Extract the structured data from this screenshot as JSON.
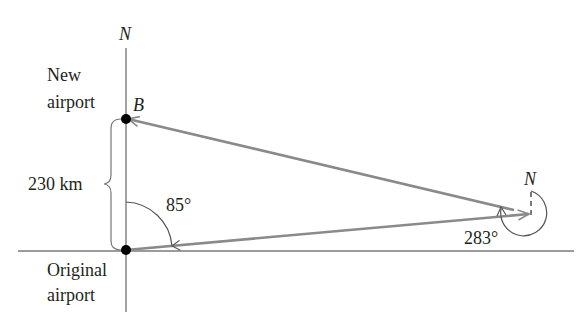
{
  "diagram": {
    "labels": {
      "north_top": "N",
      "north_right": "N",
      "point_b": "B",
      "new_airport_line1": "New",
      "new_airport_line2": "airport",
      "original_line1": "Original",
      "original_line2": "airport",
      "distance": "230 km",
      "angle_origin": "85°",
      "angle_right": "283°"
    },
    "points": {
      "original_airport": {
        "x": 126,
        "y": 250
      },
      "new_airport_B": {
        "x": 126,
        "y": 119
      },
      "turn_point": {
        "x": 531,
        "y": 214
      }
    },
    "colors": {
      "path": "#8a8a8a",
      "axis": "#7a7a7a",
      "text": "#231f20",
      "dot": "#000000"
    }
  }
}
